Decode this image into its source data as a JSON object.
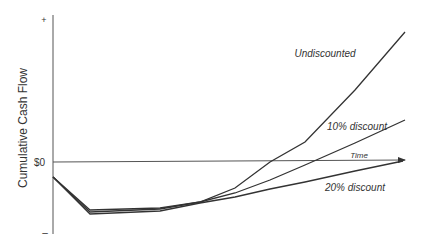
{
  "chart_data": {
    "type": "line",
    "title": "",
    "xlabel": "Time",
    "ylabel": "Cumulative Cash Flow",
    "y_ticks": [
      "+",
      "$0",
      "–"
    ],
    "grid": false,
    "legend_position": "inline labels",
    "x": [
      0,
      1,
      2,
      3,
      4,
      5,
      6,
      7,
      8
    ],
    "series": [
      {
        "name": "Undiscounted",
        "label": "Undiscounted",
        "points": [
          [
            53,
            177
          ],
          [
            90,
            210
          ],
          [
            160,
            208
          ],
          [
            200,
            202
          ],
          [
            235,
            188
          ],
          [
            270,
            162
          ],
          [
            305,
            142
          ],
          [
            355,
            90
          ],
          [
            405,
            32
          ]
        ]
      },
      {
        "name": "10% discount",
        "label": "10% discount",
        "points": [
          [
            53,
            177
          ],
          [
            90,
            212
          ],
          [
            160,
            209
          ],
          [
            200,
            202
          ],
          [
            235,
            193
          ],
          [
            270,
            180
          ],
          [
            305,
            165
          ],
          [
            355,
            143
          ],
          [
            405,
            120
          ]
        ]
      },
      {
        "name": "20% discount",
        "label": "20% discount",
        "points": [
          [
            53,
            177
          ],
          [
            90,
            214
          ],
          [
            160,
            211
          ],
          [
            200,
            203
          ],
          [
            235,
            197
          ],
          [
            270,
            189
          ],
          [
            305,
            182
          ],
          [
            355,
            171
          ],
          [
            403,
            161
          ]
        ]
      }
    ],
    "annotations": [
      "Undiscounted",
      "10% discount",
      "20% discount",
      "Time"
    ]
  },
  "labels": {
    "ylabel": "Cumulative Cash Flow",
    "plus": "+",
    "zero": "$0",
    "minus": "–",
    "time": "Time",
    "undiscounted": "Undiscounted",
    "ten": "10% discount",
    "twenty": "20% discount"
  },
  "colors": {
    "line": "#333333",
    "axis": "#555555",
    "text": "#333333"
  }
}
